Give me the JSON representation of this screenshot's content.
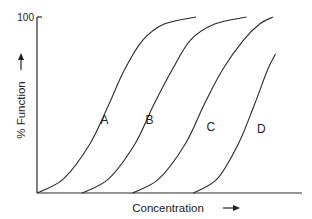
{
  "chart_data": {
    "type": "line",
    "title": "",
    "xlabel": "Concentration",
    "ylabel": "% Function",
    "xlabel_arrow": "→",
    "ylabel_arrow": "→",
    "y_ticks": [
      "100"
    ],
    "ylim": [
      0,
      100
    ],
    "xlim": [
      0,
      100
    ],
    "grid": false,
    "legend": "none",
    "series": [
      {
        "name": "A",
        "label": "A",
        "x": [
          0,
          10,
          20,
          27,
          33,
          40,
          48,
          60
        ],
        "y": [
          0,
          8,
          28,
          50,
          70,
          87,
          96,
          100
        ]
      },
      {
        "name": "B",
        "label": "B",
        "x": [
          17,
          27,
          37,
          44,
          51,
          58,
          67,
          79
        ],
        "y": [
          0,
          8,
          28,
          50,
          70,
          87,
          96,
          100
        ]
      },
      {
        "name": "C",
        "label": "C",
        "x": [
          36,
          46,
          56,
          63,
          70,
          78,
          84,
          89
        ],
        "y": [
          0,
          8,
          28,
          50,
          70,
          87,
          96,
          100
        ]
      },
      {
        "name": "D",
        "label": "D",
        "x": [
          59,
          68,
          76,
          82,
          87,
          90
        ],
        "y": [
          0,
          8,
          28,
          50,
          70,
          79
        ]
      }
    ],
    "label_points": [
      {
        "series": "A",
        "x": 24,
        "y": 39
      },
      {
        "series": "B",
        "x": 41,
        "y": 39
      },
      {
        "series": "C",
        "x": 64,
        "y": 35
      },
      {
        "series": "D",
        "x": 83,
        "y": 34
      }
    ]
  }
}
